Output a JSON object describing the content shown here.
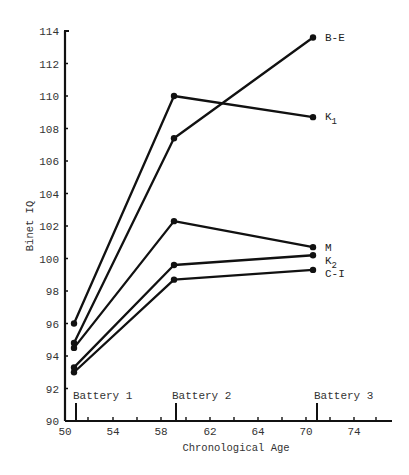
{
  "chart_data": {
    "type": "line",
    "title": "",
    "xlabel": "Chronological Age",
    "ylabel": "Binet IQ",
    "xlim": [
      50,
      78
    ],
    "ylim": [
      90,
      114
    ],
    "x_tick_labels": [
      "50",
      "54",
      "58",
      "62",
      "64",
      "70",
      "74"
    ],
    "y_tick_labels": [
      "90",
      "92",
      "94",
      "96",
      "98",
      "100",
      "102",
      "104",
      "106",
      "108",
      "110",
      "112",
      "114"
    ],
    "grid": false,
    "legend_position": "inline-right",
    "annotations": [
      {
        "text": "Battery 1",
        "x": 50.9
      },
      {
        "text": "Battery 2",
        "x": 59.25
      },
      {
        "text": "Battery 3",
        "x": 71.0
      }
    ],
    "x": [
      50.75,
      59.1,
      70.7
    ],
    "series": [
      {
        "name": "B-E",
        "sub": "",
        "values": [
          94.8,
          107.4,
          113.6
        ]
      },
      {
        "name": "K",
        "sub": "1",
        "values": [
          96.0,
          110.0,
          108.7
        ]
      },
      {
        "name": "M",
        "sub": "",
        "values": [
          94.5,
          102.3,
          100.7
        ]
      },
      {
        "name": "K",
        "sub": "2",
        "values": [
          93.3,
          99.6,
          100.2
        ]
      },
      {
        "name": "C-I",
        "sub": "",
        "values": [
          93.0,
          98.7,
          99.3
        ]
      }
    ]
  }
}
